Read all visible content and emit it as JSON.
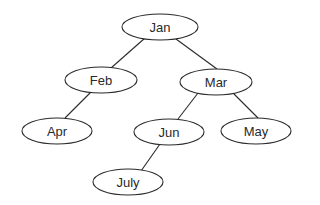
{
  "diagram": {
    "type": "binary-tree",
    "nodes": [
      {
        "id": "jan",
        "label": "Jan",
        "x": 158,
        "y": 27
      },
      {
        "id": "feb",
        "label": "Feb",
        "x": 101,
        "y": 80
      },
      {
        "id": "mar",
        "label": "Mar",
        "x": 216,
        "y": 82
      },
      {
        "id": "apr",
        "label": "Apr",
        "x": 57,
        "y": 131
      },
      {
        "id": "jun",
        "label": "Jun",
        "x": 169,
        "y": 132
      },
      {
        "id": "may",
        "label": "May",
        "x": 256,
        "y": 131
      },
      {
        "id": "july",
        "label": "July",
        "x": 128,
        "y": 182
      }
    ],
    "edges": [
      {
        "from": "jan",
        "to": "feb"
      },
      {
        "from": "jan",
        "to": "mar"
      },
      {
        "from": "feb",
        "to": "apr"
      },
      {
        "from": "mar",
        "to": "jun"
      },
      {
        "from": "mar",
        "to": "may"
      },
      {
        "from": "jun",
        "to": "july"
      }
    ],
    "style": {
      "stroke": "#2a2a2a",
      "fill": "#ffffff"
    }
  }
}
